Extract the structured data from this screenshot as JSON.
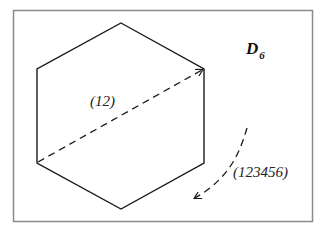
{
  "diagram": {
    "group_label": "D",
    "group_subscript": "6",
    "reflection_label": "(12)",
    "rotation_label": "(123456)",
    "colors": {
      "frame": "#8a8a8a",
      "stroke": "#1a1a1a",
      "background": "#ffffff"
    }
  }
}
